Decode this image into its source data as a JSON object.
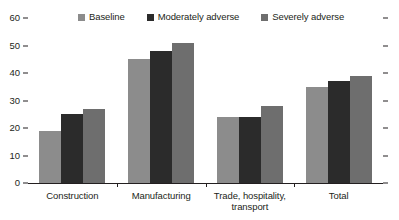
{
  "chart_data": {
    "type": "bar",
    "title": "",
    "subtitle": "",
    "xlabel": "",
    "ylabel": "",
    "ylim": [
      0,
      60
    ],
    "yticks": [
      0,
      10,
      20,
      30,
      40,
      50,
      60
    ],
    "grid": false,
    "legend_position": "top-center",
    "categories": [
      "Construction",
      "Manufacturing",
      "Trade, hospitality, transport",
      "Total"
    ],
    "category_lines": [
      [
        "Construction"
      ],
      [
        "Manufacturing"
      ],
      [
        "Trade, hospitality,",
        "transport"
      ],
      [
        "Total"
      ]
    ],
    "series": [
      {
        "name": "Baseline",
        "color": "#8c8c8c",
        "values": [
          19,
          45,
          24,
          35
        ]
      },
      {
        "name": "Moderately adverse",
        "color": "#2b2b2b",
        "values": [
          25,
          48,
          24,
          37
        ]
      },
      {
        "name": "Severely adverse",
        "color": "#6e6e6e",
        "values": [
          27,
          51,
          28,
          39
        ]
      }
    ]
  },
  "colors": {
    "axis": "#231f20",
    "background": "#ffffff",
    "baseline": "#8c8c8c",
    "moderately_adverse": "#2b2b2b",
    "severely_adverse": "#6e6e6e"
  }
}
